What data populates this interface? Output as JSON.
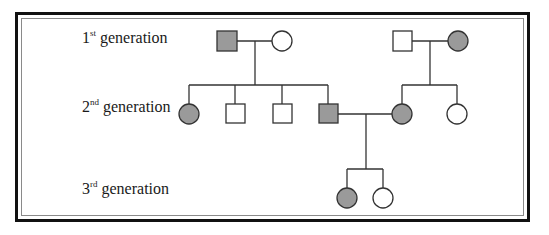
{
  "diagram": {
    "type": "pedigree-chart",
    "colors": {
      "affected_fill": "#9a9a9a",
      "unaffected_fill": "#ffffff",
      "stroke": "#333333",
      "frame": "#111111"
    },
    "labels": [
      {
        "num": "1",
        "suffix": "st",
        "text": " generation"
      },
      {
        "num": "2",
        "suffix": "nd",
        "text": " generation"
      },
      {
        "num": "3",
        "suffix": "rd",
        "text": " generation"
      }
    ],
    "legend_semantics": {
      "square": "male",
      "circle": "female",
      "shaded": "affected",
      "unshaded": "unaffected"
    },
    "individuals": [
      {
        "id": "I-1",
        "generation": 1,
        "sex": "male",
        "affected": true
      },
      {
        "id": "I-2",
        "generation": 1,
        "sex": "female",
        "affected": false
      },
      {
        "id": "I-3",
        "generation": 1,
        "sex": "male",
        "affected": false
      },
      {
        "id": "I-4",
        "generation": 1,
        "sex": "female",
        "affected": true
      },
      {
        "id": "II-1",
        "generation": 2,
        "sex": "female",
        "affected": true
      },
      {
        "id": "II-2",
        "generation": 2,
        "sex": "male",
        "affected": false
      },
      {
        "id": "II-3",
        "generation": 2,
        "sex": "male",
        "affected": false
      },
      {
        "id": "II-4",
        "generation": 2,
        "sex": "male",
        "affected": true
      },
      {
        "id": "II-5",
        "generation": 2,
        "sex": "female",
        "affected": true
      },
      {
        "id": "II-6",
        "generation": 2,
        "sex": "female",
        "affected": false
      },
      {
        "id": "III-1",
        "generation": 3,
        "sex": "female",
        "affected": true
      },
      {
        "id": "III-2",
        "generation": 3,
        "sex": "female",
        "affected": false
      }
    ]
  }
}
